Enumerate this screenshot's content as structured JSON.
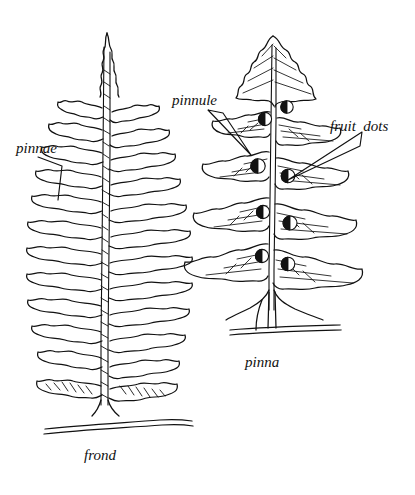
{
  "figure": {
    "kind": "botanical-line-drawing",
    "background_color": "#ffffff",
    "ink_color": "#111111"
  },
  "labels": [
    {
      "id": "pinnae",
      "text": "pinnae",
      "style": "italic",
      "points_to": "frond-pinnae"
    },
    {
      "id": "pinnule",
      "text": "pinnule",
      "style": "italic",
      "points_to": "pinna-pinnules"
    },
    {
      "id": "fruit_dots",
      "text": "fruit  dots",
      "style": "italic",
      "points_to": "pinna-sori"
    }
  ],
  "captions": [
    {
      "id": "frond",
      "text": "frond",
      "style": "italic",
      "for": "left-figure"
    },
    {
      "id": "pinna",
      "text": "pinna",
      "style": "italic",
      "for": "right-figure"
    }
  ],
  "frond": {
    "name": "fern-frond",
    "description": "tapering lance-shaped frond with finely lobed pinnae on a textured rachis rising from a ground line",
    "pinnae_pairs": 11,
    "apex": "acute",
    "rachis": "textured",
    "ground_line": true
  },
  "pinna": {
    "name": "magnified-pinna",
    "description": "single pinna enlarged, showing lobed pinnules with veins and round fruit dots along the midrib",
    "pinnule_pairs": 6,
    "ground_line": true,
    "fruit_dots": {
      "name": "sori",
      "count": 8,
      "appearance": "round, half-filled black"
    }
  }
}
